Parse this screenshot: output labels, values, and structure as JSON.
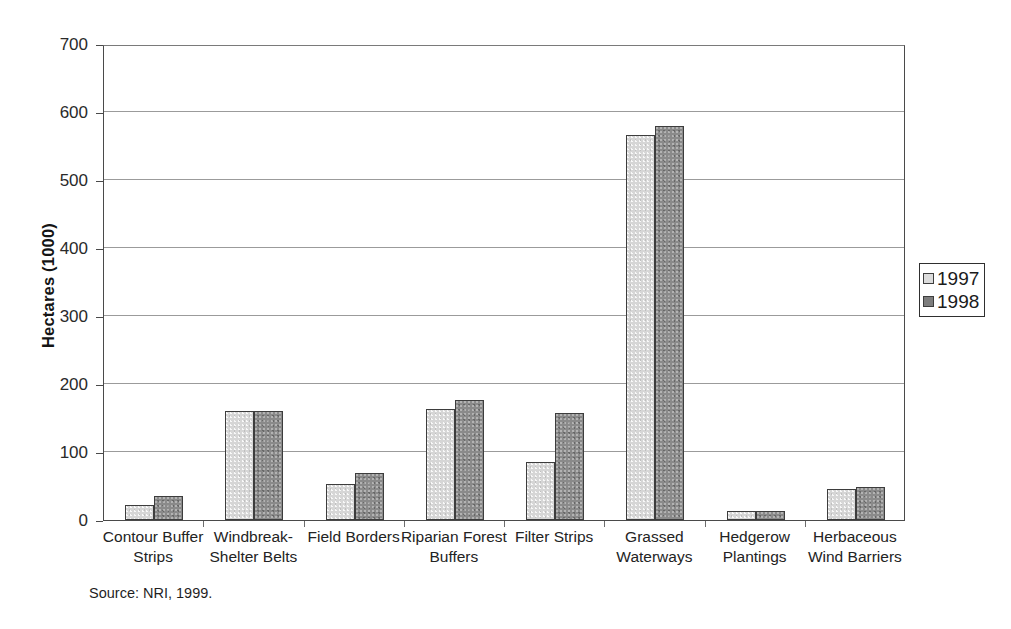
{
  "chart_data": {
    "type": "bar",
    "title": "",
    "xlabel": "",
    "ylabel": "Hectares (1000)",
    "ylim": [
      0,
      700
    ],
    "ytick_interval": 100,
    "yticks": [
      0,
      100,
      200,
      300,
      400,
      500,
      600,
      700
    ],
    "grid": true,
    "legend_position": "right",
    "categories": [
      "Contour Buffer\nStrips",
      "Windbreak-\nShelter Belts",
      "Field Borders",
      "Riparian Forest\nBuffers",
      "Filter Strips",
      "Grassed\nWaterways",
      "Hedgerow\nPlantings",
      "Herbaceous\nWind Barriers"
    ],
    "series": [
      {
        "name": "1997",
        "color": "#d6d6d6",
        "values": [
          22,
          160,
          53,
          163,
          86,
          566,
          13,
          46
        ]
      },
      {
        "name": "1998",
        "color": "#8a8a8a",
        "values": [
          35,
          161,
          69,
          176,
          157,
          580,
          13,
          49
        ]
      }
    ],
    "source_note": "Source: NRI, 1999."
  },
  "legend": {
    "entries": [
      {
        "label": "1997",
        "swatch": "light-gray-swatch"
      },
      {
        "label": "1998",
        "swatch": "dark-gray-swatch"
      }
    ]
  },
  "axes": {
    "y_title": "Hectares (1000)",
    "y_tick_labels": [
      "700",
      "600",
      "500",
      "400",
      "300",
      "200",
      "100",
      "0"
    ]
  },
  "footer": {
    "source": "Source: NRI, 1999."
  },
  "colors": {
    "series_1997": "#d6d6d6",
    "series_1998": "#8a8a8a",
    "axis": "#4a4a4a",
    "gridline": "#9b9b9b",
    "text": "#1a1a1a"
  }
}
